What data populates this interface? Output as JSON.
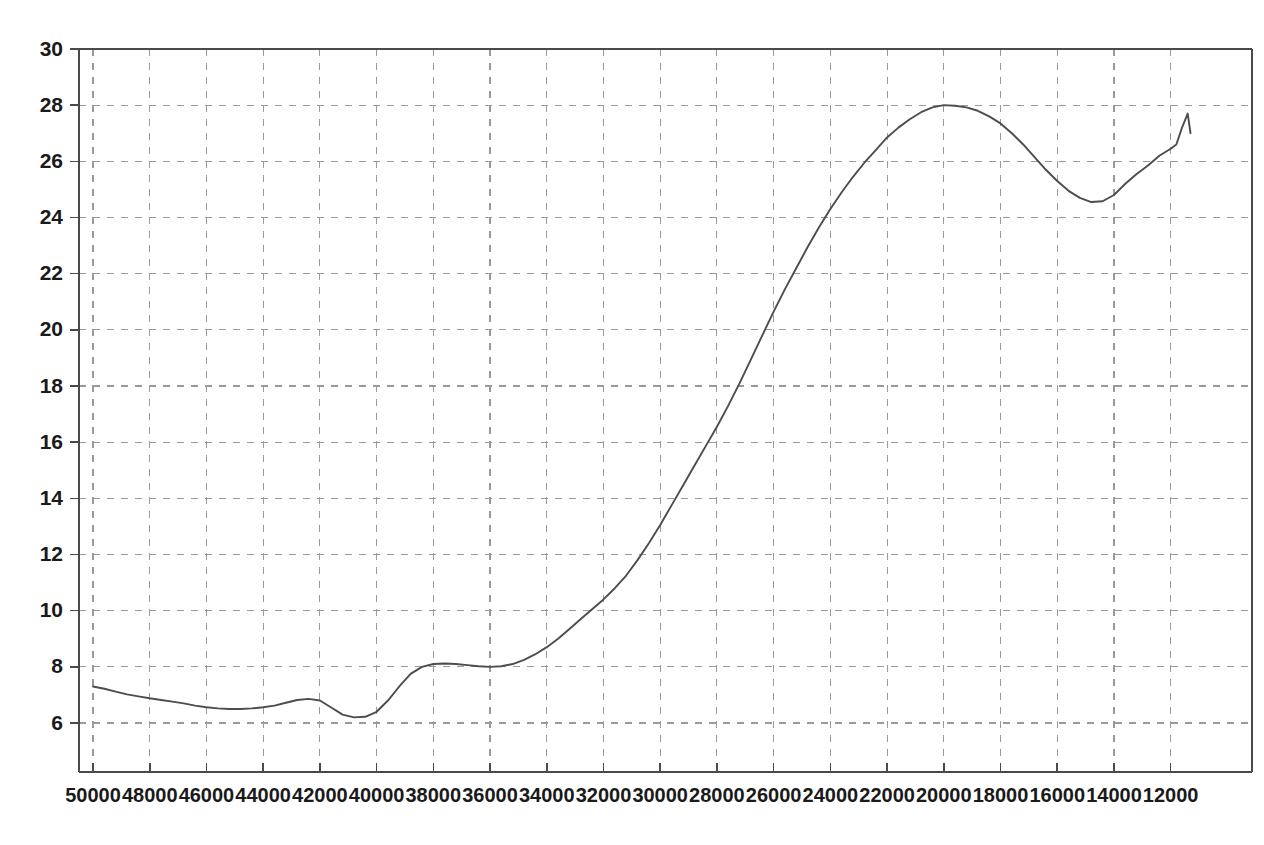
{
  "chart_data": {
    "type": "line",
    "title": "",
    "subtitle": "",
    "xlabel": "",
    "ylabel": "",
    "xlim": [
      50000,
      11200
    ],
    "ylim": [
      5.0,
      30.2
    ],
    "x_inverted": true,
    "grid": true,
    "legend": null,
    "legend_position": "none",
    "x_ticks": [
      50000,
      48000,
      46000,
      44000,
      42000,
      40000,
      38000,
      36000,
      34000,
      32000,
      30000,
      28000,
      26000,
      24000,
      22000,
      20000,
      18000,
      16000,
      14000,
      12000
    ],
    "x_tick_labels": [
      "50000",
      "48000",
      "46000",
      "44000",
      "42000",
      "40000",
      "38000",
      "36000",
      "34000",
      "32000",
      "30000",
      "28000",
      "26000",
      "24000",
      "22000",
      "20000",
      "18000",
      "16000",
      "14000",
      "12000"
    ],
    "y_ticks": [
      6,
      8,
      10,
      12,
      14,
      16,
      18,
      20,
      22,
      24,
      26,
      28,
      30
    ],
    "y_tick_labels": [
      "6",
      "8",
      "10",
      "12",
      "14",
      "16",
      "18",
      "20",
      "22",
      "24",
      "26",
      "28",
      "30"
    ],
    "series": [
      {
        "name": "series-1",
        "color": "#4d4d4d",
        "x": [
          50000,
          49600,
          49200,
          48800,
          48400,
          48000,
          47600,
          47200,
          46800,
          46400,
          46000,
          45600,
          45200,
          44800,
          44400,
          44000,
          43600,
          43200,
          42800,
          42400,
          42000,
          41600,
          41200,
          40800,
          40400,
          40000,
          39600,
          39200,
          38800,
          38400,
          38000,
          37600,
          37200,
          36800,
          36400,
          36000,
          35600,
          35200,
          34800,
          34400,
          34000,
          33600,
          33200,
          32800,
          32400,
          32000,
          31600,
          31200,
          30800,
          30400,
          30000,
          29600,
          29200,
          28800,
          28400,
          28000,
          27600,
          27200,
          26800,
          26400,
          26000,
          25600,
          25200,
          24800,
          24400,
          24000,
          23600,
          23200,
          22800,
          22400,
          22000,
          21600,
          21200,
          20800,
          20400,
          20000,
          19600,
          19200,
          18800,
          18400,
          18000,
          17600,
          17200,
          16800,
          16400,
          16000,
          15600,
          15200,
          14800,
          14400,
          14000,
          13600,
          13200,
          12800,
          12400,
          12000,
          11800,
          11600,
          11400,
          11300
        ],
        "y": [
          7.3,
          7.22,
          7.12,
          7.02,
          6.95,
          6.88,
          6.82,
          6.76,
          6.7,
          6.62,
          6.56,
          6.52,
          6.5,
          6.5,
          6.52,
          6.56,
          6.62,
          6.72,
          6.82,
          6.86,
          6.8,
          6.55,
          6.3,
          6.2,
          6.22,
          6.4,
          6.8,
          7.3,
          7.75,
          8.0,
          8.1,
          8.12,
          8.1,
          8.06,
          8.02,
          8.0,
          8.02,
          8.1,
          8.25,
          8.45,
          8.7,
          9.0,
          9.35,
          9.7,
          10.05,
          10.4,
          10.8,
          11.25,
          11.8,
          12.4,
          13.05,
          13.75,
          14.45,
          15.15,
          15.85,
          16.55,
          17.3,
          18.1,
          18.95,
          19.8,
          20.65,
          21.45,
          22.2,
          22.95,
          23.65,
          24.3,
          24.9,
          25.45,
          25.95,
          26.4,
          26.85,
          27.2,
          27.5,
          27.75,
          27.92,
          28.0,
          27.98,
          27.92,
          27.8,
          27.6,
          27.35,
          27.0,
          26.6,
          26.15,
          25.7,
          25.3,
          24.95,
          24.7,
          24.55,
          24.58,
          24.8,
          25.2,
          25.55,
          25.85,
          26.2,
          26.45,
          26.6,
          27.2,
          27.7,
          27.0
        ],
        "annotations": {
          "start_value": 7.3,
          "local_minimum_left": 6.5,
          "local_bump_peak": 6.86,
          "local_minimum_dip": 6.2,
          "plateau_value": 8.1,
          "maximum_value": 28.0,
          "maximum_at_x": 20000,
          "late_trough_value": 24.55,
          "late_trough_at_x": 14800,
          "terminal_spike_value": 27.7,
          "end_value": 27.0
        }
      }
    ]
  }
}
